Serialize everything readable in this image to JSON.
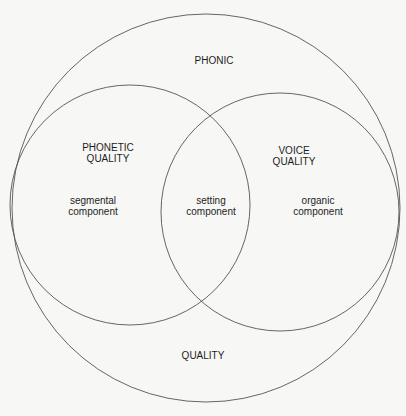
{
  "diagram": {
    "type": "venn",
    "colors": {
      "background": "#f7f7f5",
      "stroke": "#555555",
      "text": "#1d1d1d"
    },
    "circles": [
      {
        "id": "outer",
        "cx": 206,
        "cy": 208,
        "r": 194,
        "label": [
          "PHONIC",
          "QUALITY"
        ]
      },
      {
        "id": "left",
        "cx": 130,
        "cy": 205,
        "r": 120,
        "label": [
          "PHONETIC",
          "QUALITY"
        ]
      },
      {
        "id": "right",
        "cx": 280,
        "cy": 212,
        "r": 119,
        "label": [
          "VOICE",
          "QUALITY"
        ]
      }
    ],
    "labels": {
      "top": "PHONIC",
      "bottom": "QUALITY",
      "phonetic_quality": {
        "line1": "PHONETIC",
        "line2": "QUALITY"
      },
      "voice_quality": {
        "line1": "VOICE",
        "line2": "QUALITY"
      },
      "segmental": {
        "line1": "segmental",
        "line2": "component"
      },
      "setting": {
        "line1": "setting",
        "line2": "component"
      },
      "organic": {
        "line1": "organic",
        "line2": "component"
      }
    }
  }
}
